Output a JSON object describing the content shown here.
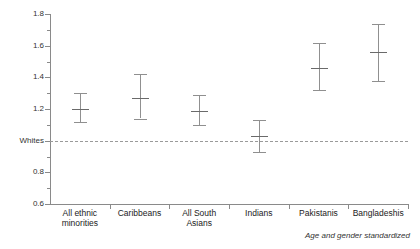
{
  "chart_data": {
    "type": "scatter",
    "title": "",
    "subtitle": "",
    "xlabel": "",
    "ylabel": "",
    "ylim": [
      0.6,
      1.8
    ],
    "grid": false,
    "legend": null,
    "annotation": "Age and gender standardized",
    "reference_line": {
      "label": "Whites",
      "value": 1.0,
      "style": "dashed"
    },
    "y_ticks": [
      {
        "value": 1.8,
        "label": "1.8",
        "major": true
      },
      {
        "value": 1.7,
        "label": "",
        "major": false
      },
      {
        "value": 1.6,
        "label": "1.6",
        "major": true
      },
      {
        "value": 1.5,
        "label": "",
        "major": false
      },
      {
        "value": 1.4,
        "label": "1.4",
        "major": true
      },
      {
        "value": 1.3,
        "label": "",
        "major": false
      },
      {
        "value": 1.2,
        "label": "1.2",
        "major": true
      },
      {
        "value": 1.1,
        "label": "",
        "major": false
      },
      {
        "value": 1.0,
        "label": "Whites",
        "major": true
      },
      {
        "value": 0.9,
        "label": "",
        "major": false
      },
      {
        "value": 0.8,
        "label": "0.8",
        "major": true
      },
      {
        "value": 0.7,
        "label": "",
        "major": false
      },
      {
        "value": 0.6,
        "label": "0.6",
        "major": true
      }
    ],
    "categories": [
      "All ethnic minorities",
      "Caribbeans",
      "All South Asians",
      "Indians",
      "Pakistanis",
      "Bangladeshis"
    ],
    "values": [
      1.2,
      1.27,
      1.19,
      1.03,
      1.46,
      1.56
    ],
    "ci_low": [
      1.12,
      1.14,
      1.1,
      0.93,
      1.32,
      1.38
    ],
    "ci_high": [
      1.3,
      1.42,
      1.29,
      1.13,
      1.62,
      1.74
    ],
    "points": [
      {
        "category": "All ethnic minorities",
        "label_line1": "All ethnic",
        "label_line2": "minorities",
        "value": 1.2,
        "ci_low": 1.12,
        "ci_high": 1.3
      },
      {
        "category": "Caribbeans",
        "label_line1": "Caribbeans",
        "label_line2": "",
        "value": 1.27,
        "ci_low": 1.14,
        "ci_high": 1.42
      },
      {
        "category": "All South Asians",
        "label_line1": "All South",
        "label_line2": "Asians",
        "value": 1.19,
        "ci_low": 1.1,
        "ci_high": 1.29
      },
      {
        "category": "Indians",
        "label_line1": "Indians",
        "label_line2": "",
        "value": 1.03,
        "ci_low": 0.93,
        "ci_high": 1.13
      },
      {
        "category": "Pakistanis",
        "label_line1": "Pakistanis",
        "label_line2": "",
        "value": 1.46,
        "ci_low": 1.32,
        "ci_high": 1.62
      },
      {
        "category": "Bangladeshis",
        "label_line1": "Bangladeshis",
        "label_line2": "",
        "value": 1.56,
        "ci_low": 1.38,
        "ci_high": 1.74
      }
    ]
  },
  "colors": {
    "axis": "#8a8a8a",
    "errorbar": "#909090",
    "marker": "#6a6a6a",
    "reference": "#9a9a9a",
    "text": "#222222",
    "background": "#ffffff"
  }
}
